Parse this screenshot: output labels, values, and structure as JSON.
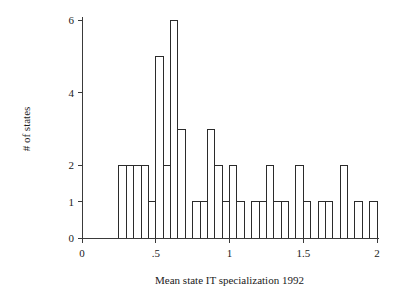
{
  "chart_data": {
    "type": "bar",
    "chart_subtype": "histogram",
    "title": "",
    "xlabel": "Mean state IT specialization 1992",
    "ylabel": "# of states",
    "xlim": [
      0,
      2
    ],
    "ylim": [
      0,
      6
    ],
    "xticks": [
      0,
      0.5,
      1,
      1.5,
      2
    ],
    "xtick_labels": [
      "0",
      ".5",
      "1",
      "1.5",
      "2"
    ],
    "yticks": [
      0,
      1,
      2,
      4,
      6
    ],
    "ytick_labels": [
      "0",
      "1",
      "2",
      "4",
      "6"
    ],
    "grid": false,
    "legend": null,
    "bin_width": 0.05,
    "bar_fill": "#ffffff",
    "bar_stroke": "#2b2b2b",
    "axis_color": "#3a3a3a",
    "background": "#ffffff",
    "bins": [
      {
        "x0": 0.25,
        "x1": 0.3,
        "value": 2
      },
      {
        "x0": 0.3,
        "x1": 0.35,
        "value": 2
      },
      {
        "x0": 0.35,
        "x1": 0.4,
        "value": 2
      },
      {
        "x0": 0.4,
        "x1": 0.45,
        "value": 2
      },
      {
        "x0": 0.45,
        "x1": 0.5,
        "value": 1
      },
      {
        "x0": 0.5,
        "x1": 0.55,
        "value": 5
      },
      {
        "x0": 0.55,
        "x1": 0.6,
        "value": 2
      },
      {
        "x0": 0.6,
        "x1": 0.65,
        "value": 6
      },
      {
        "x0": 0.65,
        "x1": 0.7,
        "value": 3
      },
      {
        "x0": 0.7,
        "x1": 0.75,
        "value": 0
      },
      {
        "x0": 0.75,
        "x1": 0.8,
        "value": 1
      },
      {
        "x0": 0.8,
        "x1": 0.85,
        "value": 1
      },
      {
        "x0": 0.85,
        "x1": 0.9,
        "value": 3
      },
      {
        "x0": 0.9,
        "x1": 0.95,
        "value": 2
      },
      {
        "x0": 0.95,
        "x1": 1.0,
        "value": 1
      },
      {
        "x0": 1.0,
        "x1": 1.05,
        "value": 2
      },
      {
        "x0": 1.05,
        "x1": 1.1,
        "value": 1
      },
      {
        "x0": 1.1,
        "x1": 1.15,
        "value": 0
      },
      {
        "x0": 1.15,
        "x1": 1.2,
        "value": 1
      },
      {
        "x0": 1.2,
        "x1": 1.25,
        "value": 1
      },
      {
        "x0": 1.25,
        "x1": 1.3,
        "value": 2
      },
      {
        "x0": 1.3,
        "x1": 1.35,
        "value": 1
      },
      {
        "x0": 1.35,
        "x1": 1.4,
        "value": 1
      },
      {
        "x0": 1.4,
        "x1": 1.45,
        "value": 0
      },
      {
        "x0": 1.45,
        "x1": 1.5,
        "value": 2
      },
      {
        "x0": 1.5,
        "x1": 1.55,
        "value": 1
      },
      {
        "x0": 1.55,
        "x1": 1.6,
        "value": 0
      },
      {
        "x0": 1.6,
        "x1": 1.65,
        "value": 1
      },
      {
        "x0": 1.65,
        "x1": 1.7,
        "value": 1
      },
      {
        "x0": 1.7,
        "x1": 1.75,
        "value": 0
      },
      {
        "x0": 1.75,
        "x1": 1.8,
        "value": 2
      },
      {
        "x0": 1.8,
        "x1": 1.85,
        "value": 0
      },
      {
        "x0": 1.85,
        "x1": 1.9,
        "value": 1
      },
      {
        "x0": 1.9,
        "x1": 1.95,
        "value": 0
      },
      {
        "x0": 1.95,
        "x1": 2.0,
        "value": 1
      }
    ]
  },
  "geometry": {
    "plot_left_px": 82,
    "plot_right_px": 377,
    "plot_baseline_px": 238,
    "plot_top_px": 20
  }
}
